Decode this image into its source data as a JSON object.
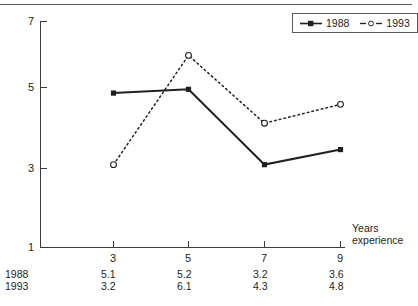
{
  "chart_data": {
    "type": "line",
    "title": "",
    "xlabel": "Years experience",
    "ylabel": "",
    "x": [
      3,
      5,
      7,
      9
    ],
    "categories": [
      "3",
      "5",
      "7",
      "9"
    ],
    "series": [
      {
        "name": "1988",
        "values": [
          5.1,
          5.2,
          3.2,
          3.6
        ],
        "line_style": "solid",
        "marker": "filled-square",
        "color": "#231f20"
      },
      {
        "name": "1993",
        "values": [
          3.2,
          6.1,
          4.3,
          4.8
        ],
        "line_style": "dotted",
        "marker": "open-circle",
        "color": "#231f20"
      }
    ],
    "ylim": [
      1,
      7
    ],
    "xlim": [
      2,
      9.7
    ],
    "ytick_labels": [
      "7",
      "5",
      "3",
      "1"
    ],
    "ytick_values": [
      7,
      5,
      3,
      1
    ],
    "xtick_labels": [
      "3",
      "5",
      "7",
      "9"
    ],
    "grid": false,
    "legend_position": "top-right"
  },
  "axes": {
    "y_ticks": [
      {
        "label": "7",
        "value": 7
      },
      {
        "label": "5",
        "value": 5
      },
      {
        "label": "3",
        "value": 3
      },
      {
        "label": "1",
        "value": 1
      }
    ],
    "x_ticks": [
      {
        "label": "3",
        "value": 3
      },
      {
        "label": "5",
        "value": 5
      },
      {
        "label": "7",
        "value": 7
      },
      {
        "label": "9",
        "value": 9
      }
    ],
    "caption_line1": "Years",
    "caption_line2": "experience"
  },
  "legend": {
    "entries": [
      {
        "label": "1988",
        "marker": "filled-square",
        "line": "solid"
      },
      {
        "label": "1993",
        "marker": "open-circle",
        "line": "dotted"
      }
    ]
  },
  "table": {
    "rows": [
      {
        "label": "1988",
        "cells": [
          "5.1",
          "5.2",
          "3.2",
          "3.6"
        ]
      },
      {
        "label": "1993",
        "cells": [
          "3.2",
          "6.1",
          "4.3",
          "4.8"
        ]
      }
    ]
  },
  "colors": {
    "ink": "#231f20",
    "axis": "#3b3b3d",
    "rule": "#58585b",
    "background": "#ffffff"
  }
}
